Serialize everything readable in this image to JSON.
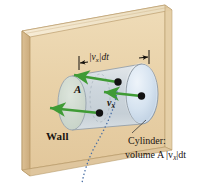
{
  "figure": {
    "labels": {
      "wall": "Wall",
      "area": "A",
      "velocity": "v",
      "velocity_subscript": "x",
      "dimension_prefix": "|v",
      "dimension_subscript": "x",
      "dimension_suffix": "|dt",
      "caption_line1": "Cylinder:",
      "caption_line2_prefix": "volume A |v",
      "caption_line2_subscript": "x",
      "caption_line2_suffix": "|dt"
    },
    "colors": {
      "wall_face": "#e7cfa4",
      "wall_top": "#f3e3c4",
      "wall_side": "#d9bc8c",
      "wall_edge": "#b89a69",
      "cylinder_body": "#cfd9e2",
      "cylinder_cap": "#d8e4ef",
      "cylinder_outline": "#8a96a3",
      "area_tint": "#cfd9cf",
      "arrow_green": "#3f9b35",
      "particle": "#121212",
      "leader_dotted": "#4a6fa5",
      "text": "#1a1410"
    },
    "elements": {
      "particle_count": 4,
      "arrow_count": 3,
      "dimension_line": "|vx|dt",
      "leader_style": "dotted-curve"
    }
  }
}
